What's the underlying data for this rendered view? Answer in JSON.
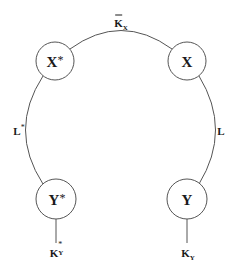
{
  "diagram": {
    "colors": {
      "stroke": "#555555",
      "text": "#1a1a1a",
      "background": "#ffffff"
    },
    "nodes": [
      {
        "id": "x_star",
        "label": "X",
        "star": "*",
        "cx": 55,
        "cy": 61,
        "r": 19
      },
      {
        "id": "x",
        "label": "X",
        "star": "",
        "cx": 187,
        "cy": 61,
        "r": 19
      },
      {
        "id": "y_star",
        "label": "Y",
        "star": "*",
        "cx": 56,
        "cy": 199,
        "r": 20
      },
      {
        "id": "y",
        "label": "Y",
        "star": "",
        "cx": 187,
        "cy": 199,
        "r": 20
      }
    ],
    "edges": [
      {
        "id": "k_bar_x",
        "from": "x_star",
        "to": "x",
        "label": "K",
        "label_sub": "X",
        "label_bar": true
      },
      {
        "id": "l_star",
        "from": "x_star",
        "to": "y_star",
        "label": "L",
        "label_sup": "*"
      },
      {
        "id": "l",
        "from": "x",
        "to": "y",
        "label": "L"
      },
      {
        "id": "k_y_star",
        "from": "y_star",
        "to": "k_y_star_end",
        "label": "K",
        "label_sub": "Y",
        "label_sup": "*"
      },
      {
        "id": "k_y",
        "from": "y",
        "to": "k_y_end",
        "label": "K",
        "label_sub": "Y"
      }
    ]
  }
}
